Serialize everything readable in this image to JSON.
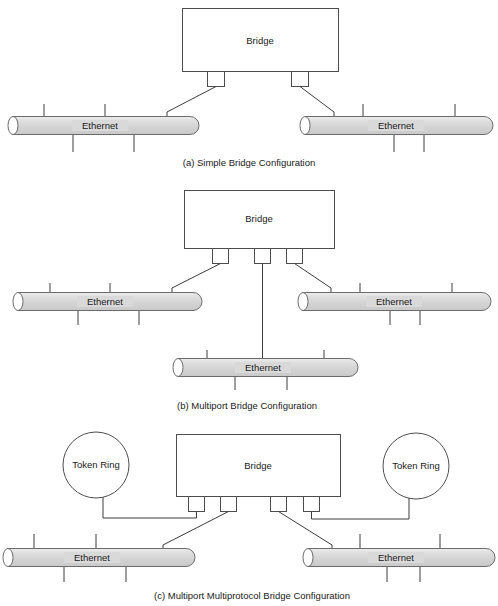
{
  "figure": {
    "background_color": "#ffffff",
    "line_color": "#4d4d4d",
    "cable_fill_color": "#d9d9d9",
    "box_fill_color": "#ffffff"
  },
  "panels": [
    {
      "id": "a",
      "caption": "(a) Simple Bridge Configuration",
      "bridge": {
        "label": "Bridge",
        "ports": 2
      },
      "networks": [
        {
          "type": "ethernet",
          "label": "Ethernet",
          "position": "left"
        },
        {
          "type": "ethernet",
          "label": "Ethernet",
          "position": "right"
        }
      ]
    },
    {
      "id": "b",
      "caption": "(b) Multiport Bridge Configuration",
      "bridge": {
        "label": "Bridge",
        "ports": 3
      },
      "networks": [
        {
          "type": "ethernet",
          "label": "Ethernet",
          "position": "left"
        },
        {
          "type": "ethernet",
          "label": "Ethernet",
          "position": "right"
        },
        {
          "type": "ethernet",
          "label": "Ethernet",
          "position": "bottom"
        }
      ]
    },
    {
      "id": "c",
      "caption": "(c) Multiport Multiprotocol Bridge Configuration",
      "bridge": {
        "label": "Bridge",
        "ports": 4
      },
      "networks": [
        {
          "type": "token-ring",
          "label": "Token Ring",
          "position": "left"
        },
        {
          "type": "token-ring",
          "label": "Token Ring",
          "position": "right"
        },
        {
          "type": "ethernet",
          "label": "Ethernet",
          "position": "bottom-left"
        },
        {
          "type": "ethernet",
          "label": "Ethernet",
          "position": "bottom-right"
        }
      ]
    }
  ],
  "labels": {
    "bridge_a": "Bridge",
    "bridge_b": "Bridge",
    "bridge_c": "Bridge",
    "ethernet_a_left": "Ethernet",
    "ethernet_a_right": "Ethernet",
    "ethernet_b_left": "Ethernet",
    "ethernet_b_right": "Ethernet",
    "ethernet_b_bottom": "Ethernet",
    "ethernet_c_left": "Ethernet",
    "ethernet_c_right": "Ethernet",
    "token_ring_c_left": "Token Ring",
    "token_ring_c_right": "Token Ring",
    "caption_a": "(a) Simple Bridge Configuration",
    "caption_b": "(b) Multiport Bridge Configuration",
    "caption_c": "(c) Multiport Multiprotocol Bridge Configuration"
  }
}
